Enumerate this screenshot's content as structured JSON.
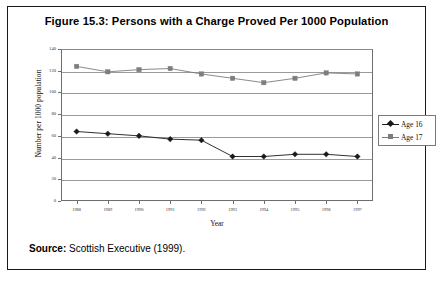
{
  "figure": {
    "title": "Figure 15.3: Persons with a Charge Proved Per 1000 Population",
    "source_label": "Source:",
    "source_text": "Scottish Executive (1999)."
  },
  "chart_data": {
    "type": "line",
    "title": "Figure 15.3: Persons with a Charge Proved Per 1000 Population",
    "xlabel": "Year",
    "ylabel": "Number per 1000 population",
    "categories": [
      "1988",
      "1989",
      "1990",
      "1991",
      "1992",
      "1993",
      "1994",
      "1995",
      "1996",
      "1997"
    ],
    "x": [
      1988,
      1989,
      1990,
      1991,
      1992,
      1993,
      1994,
      1995,
      1996,
      1997
    ],
    "ylim": [
      0,
      140
    ],
    "yticks": [
      0,
      20,
      40,
      60,
      80,
      100,
      120,
      140
    ],
    "ytick_labels": [
      "0",
      "20",
      "40",
      "60",
      "80",
      "100",
      "120",
      "140"
    ],
    "grid": true,
    "grid_axis": "y",
    "legend_position": "right",
    "series": [
      {
        "name": "Age 16",
        "color": "#1a1a1a",
        "marker": "diamond",
        "values": [
          64,
          62,
          60,
          57,
          56,
          41,
          41,
          43,
          43,
          41
        ]
      },
      {
        "name": "Age 17",
        "color": "#7d7d7d",
        "marker": "square",
        "values": [
          124,
          119,
          121,
          122,
          117,
          113,
          109,
          113,
          118,
          117
        ]
      }
    ]
  },
  "legend": {
    "entries": [
      {
        "label": "Age 16",
        "color": "#1a1a1a",
        "marker": "diamond"
      },
      {
        "label": "Age 17",
        "color": "#7d7d7d",
        "marker": "square"
      }
    ]
  },
  "colors": {
    "age16": "#1a1a1a",
    "age17": "#7d7d7d",
    "grid": "#9a9a9a",
    "axis": "#6e6e6e",
    "frame": "#1a1a1a"
  }
}
